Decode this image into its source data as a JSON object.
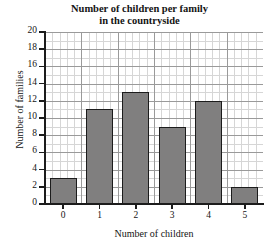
{
  "chart_data": {
    "type": "bar",
    "title": "Number of children per family in the countryside",
    "title_lines": [
      "Number of children per family",
      "in the countryside"
    ],
    "xlabel": "Number of children",
    "ylabel": "Number of families",
    "categories": [
      "0",
      "1",
      "2",
      "3",
      "4",
      "5"
    ],
    "values": [
      3,
      11,
      13,
      9,
      12,
      2
    ],
    "ylim": [
      0,
      20
    ],
    "ytick_step": 2,
    "yticks": [
      "0",
      "2",
      "4",
      "6",
      "8",
      "10",
      "12",
      "14",
      "16",
      "18",
      "20"
    ],
    "xlim": [
      -0.5,
      5.5
    ],
    "grid": true,
    "grid_minor": true,
    "legend": null,
    "bar_color": "#807f7f",
    "bar_edge_color": "#1c1c1c",
    "grid_major_color": "#9a9a9a",
    "grid_minor_color": "#d6d6d6",
    "axis_color": "#1c1c1c",
    "background": "#ffffff"
  }
}
